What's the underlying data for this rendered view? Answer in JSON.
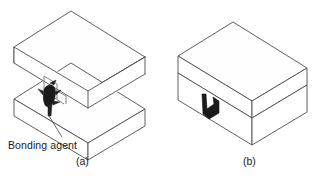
{
  "figure": {
    "background_color": "#ffffff",
    "line_color": "#4d4d4d",
    "accent_color": "#1a1a1a",
    "panels": [
      {
        "id": "a",
        "caption": "(a)",
        "description": "Two separated blocks with bonding agent applied at the joint",
        "annotations": [
          {
            "name": "bonding-agent",
            "label": "Bonding agent",
            "leader": true
          }
        ]
      },
      {
        "id": "b",
        "caption": "(b)",
        "description": "Blocks joined together showing the adhesive bond line",
        "annotations": []
      }
    ]
  },
  "labels": {
    "bonding_agent": "Bonding agent",
    "caption_a": "(a)",
    "caption_b": "(b)"
  }
}
